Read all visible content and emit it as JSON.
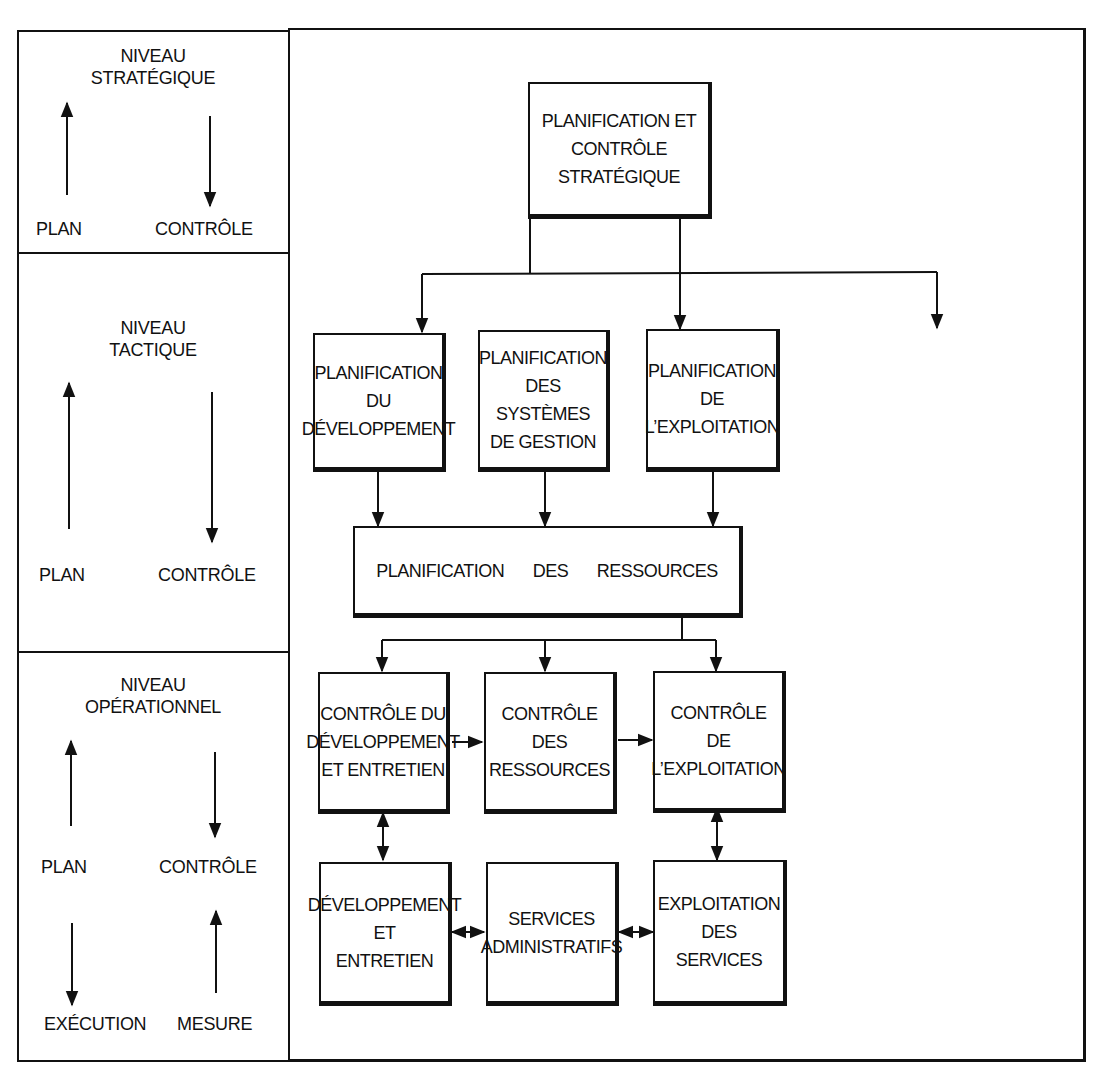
{
  "levels": [
    {
      "id": "strategique",
      "title": "NIVEAU\nSTRATÉGIQUE",
      "labels": {
        "plan": "PLAN",
        "controle": "CONTRÔLE"
      }
    },
    {
      "id": "tactique",
      "title": "NIVEAU\nTACTIQUE",
      "labels": {
        "plan": "PLAN",
        "controle": "CONTRÔLE"
      }
    },
    {
      "id": "operationnel",
      "title": "NIVEAU\nOPÉRATIONNEL",
      "labels": {
        "plan": "PLAN",
        "controle": "CONTRÔLE",
        "execution": "EXÉCUTION",
        "mesure": "MESURE"
      }
    }
  ],
  "boxes": {
    "strategic_planning": "PLANIFICATION ET\nCONTRÔLE\nSTRATÉGIQUE",
    "dev_planning": "PLANIFICATION\nDU\nDÉVELOPPEMENT",
    "mgmt_systems_planning": "PLANIFICATION\nDES SYSTÈMES\nDE GESTION",
    "ops_planning": "PLANIFICATION\nDE\nL’EXPLOITATION",
    "resource_planning": "PLANIFICATION DES RESSOURCES",
    "dev_control": "CONTRÔLE DU\nDÉVELOPPEMENT\nET ENTRETIEN",
    "resource_control": "CONTRÔLE\nDES\nRESSOURCES",
    "ops_control": "CONTRÔLE\nDE\nL’EXPLOITATION",
    "dev_maintenance": "DÉVELOPPEMENT\nET\nENTRETIEN",
    "admin_services": "SERVICES\nADMINISTRATIFS",
    "service_operations": "EXPLOITATION\nDES\nSERVICES"
  },
  "colors": {
    "ink": "#111111",
    "paper": "#ffffff"
  }
}
